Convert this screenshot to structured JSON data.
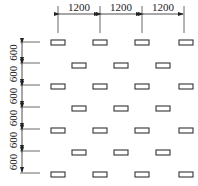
{
  "diagram": {
    "type": "staggered-grid-layout",
    "horizontal_dimensions": [
      "1200",
      "1200",
      "1200"
    ],
    "vertical_dimensions": [
      "600",
      "600",
      "600",
      "600",
      "600",
      "600"
    ],
    "colors": {
      "line": "#333333",
      "background": "#ffffff"
    },
    "rows": [
      {
        "offset": false,
        "count": 4
      },
      {
        "offset": true,
        "count": 3
      },
      {
        "offset": false,
        "count": 4
      },
      {
        "offset": true,
        "count": 3
      },
      {
        "offset": false,
        "count": 4
      },
      {
        "offset": true,
        "count": 3
      },
      {
        "offset": false,
        "count": 4
      }
    ]
  }
}
